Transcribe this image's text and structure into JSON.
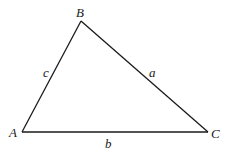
{
  "diagram": {
    "type": "triangle",
    "vertices": {
      "A": {
        "label": "A",
        "x": 22,
        "y": 132
      },
      "B": {
        "label": "B",
        "x": 81,
        "y": 21
      },
      "C": {
        "label": "C",
        "x": 208,
        "y": 132
      }
    },
    "sides": {
      "a": {
        "label": "a",
        "from": "B",
        "to": "C"
      },
      "b": {
        "label": "b",
        "from": "A",
        "to": "C"
      },
      "c": {
        "label": "c",
        "from": "A",
        "to": "B"
      }
    },
    "stroke_color": "#1a1a1a",
    "background": "#ffffff"
  }
}
